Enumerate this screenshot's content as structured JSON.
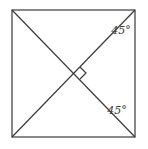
{
  "diagram": {
    "shape": "square with both diagonals",
    "square": {
      "x1": 12,
      "y1": 10,
      "x2": 135,
      "y2": 137
    },
    "center": {
      "x": 74,
      "y": 73
    },
    "right_angle_marker": true,
    "angle_labels": [
      {
        "text": "45°",
        "x": 122,
        "y": 33
      },
      {
        "text": "45°",
        "x": 118,
        "y": 113
      }
    ],
    "stroke_color": "#3a3a3a"
  }
}
